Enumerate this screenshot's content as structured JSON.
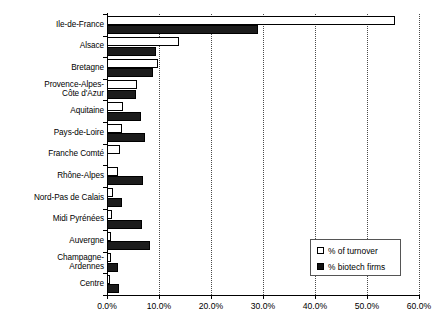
{
  "chart_data": {
    "type": "bar",
    "orientation": "horizontal",
    "title": "",
    "xlabel": "",
    "ylabel": "",
    "xlim": [
      0,
      60
    ],
    "xticks": [
      "0.0%",
      "10.0%",
      "20.0%",
      "30.0%",
      "40.0%",
      "50.0%",
      "60.0%"
    ],
    "xtick_values": [
      0,
      10,
      20,
      30,
      40,
      50,
      60
    ],
    "grid": "vertical-dotted",
    "legend_position": "bottom-right",
    "categories": [
      "Ile-de-France",
      "Alsace",
      "Bretagne",
      "Provence-Alpes-\nCôte d'Azur",
      "Aquitaine",
      "Pays-de-Loire",
      "Franche Comté",
      "Rhône-Alpes",
      "Nord-Pas de Calais",
      "Midi Pyrénées",
      "Auvergne",
      "Champagne-\nArdennes",
      "Centre"
    ],
    "series": [
      {
        "name": "% of turnover",
        "color": "#ffffff",
        "values": [
          55.4,
          13.8,
          9.8,
          5.8,
          3.1,
          2.9,
          2.5,
          2.1,
          1.2,
          1.0,
          0.8,
          0.8,
          0.6
        ]
      },
      {
        "name": "% biotech firms",
        "color": "#1c1c1c",
        "values": [
          29.0,
          9.4,
          8.8,
          5.6,
          6.5,
          7.3,
          0.0,
          6.9,
          2.9,
          6.7,
          8.3,
          2.1,
          2.3
        ]
      }
    ]
  },
  "legend": {
    "items": [
      {
        "label": "% of turnover",
        "swatch": "white-square"
      },
      {
        "label": "% biotech firms",
        "swatch": "black-square"
      }
    ]
  }
}
